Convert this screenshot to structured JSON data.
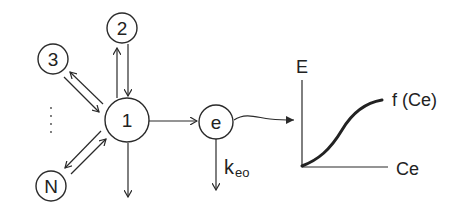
{
  "diagram": {
    "compartments": [
      {
        "id": "1",
        "label": "1",
        "role": "central compartment"
      },
      {
        "id": "2",
        "label": "2"
      },
      {
        "id": "3",
        "label": "3"
      },
      {
        "id": "N",
        "label": "N"
      },
      {
        "id": "e",
        "label": "e",
        "role": "effect compartment"
      }
    ],
    "ellipsis": "⋮",
    "elimination_rate_label": "k",
    "elimination_rate_subscript": "eo",
    "graph": {
      "y_axis_label": "E",
      "x_axis_label": "Ce",
      "curve_label": "f (Ce)"
    },
    "colors": {
      "stroke": "#2a2a2a",
      "background": "#ffffff"
    }
  }
}
